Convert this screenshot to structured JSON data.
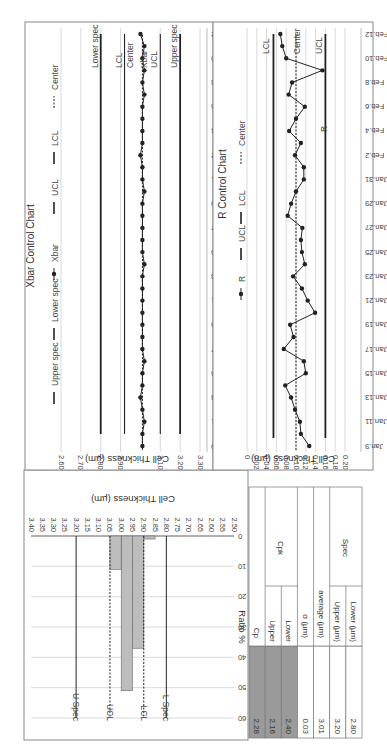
{
  "figure": {
    "orientation_deg": 180
  },
  "colors": {
    "frame": "#888888",
    "grid": "#cfcfcf",
    "line": "#222222",
    "bar_fill": "#bdbdbd",
    "table_shade": "#9a9a9a"
  },
  "chart_data": [
    {
      "type": "bar",
      "id": "histogram",
      "title": "",
      "xlabel": "Cell Thickness (µm)",
      "ylabel": "Ratio %",
      "categories": [
        "2.50",
        "2.55",
        "2.60",
        "2.65",
        "2.70",
        "2.75",
        "2.80",
        "2.85",
        "2.90",
        "2.95",
        "3.00",
        "3.05",
        "3.10",
        "3.15",
        "3.20",
        "3.25",
        "3.30",
        "3.35",
        "3.40"
      ],
      "values": [
        0,
        0,
        0,
        0,
        0,
        0,
        0,
        0,
        1,
        37,
        51,
        11,
        0,
        0,
        0,
        0,
        0,
        0,
        0
      ],
      "ylim": [
        0,
        60
      ],
      "yticks": [
        0,
        10,
        20,
        30,
        40,
        50,
        60
      ],
      "grid": true,
      "reference_lines": [
        {
          "label": "L Spec",
          "x": 2.8,
          "style": "solid"
        },
        {
          "label": "LCL",
          "x": 2.9,
          "style": "dashed"
        },
        {
          "label": "UCL",
          "x": 3.05,
          "style": "dashed"
        },
        {
          "label": "U Spec",
          "x": 3.2,
          "style": "solid"
        }
      ]
    },
    {
      "type": "line",
      "id": "xbar",
      "title": "Xbar Control Chart",
      "xlabel": "",
      "ylabel": "Cell Thickness (µm)",
      "ylim": [
        2.6,
        3.3
      ],
      "yticks": [
        "3.30",
        "3.20",
        "3.10",
        "2.90",
        "2.80",
        "2.70",
        "2.60"
      ],
      "x": [
        "Jan.9",
        "Jan.10",
        "Jan.11",
        "Jan.12",
        "Jan.13",
        "Jan.14",
        "Jan.15",
        "Jan.16",
        "Jan.17",
        "Jan.18",
        "Jan.19",
        "Jan.20",
        "Jan.21",
        "Jan.22",
        "Jan.23",
        "Jan.24",
        "Jan.25",
        "Jan.26",
        "Jan.27",
        "Jan.28",
        "Jan.29",
        "Jan.30",
        "Jan.31",
        "Feb.1",
        "Feb.2",
        "Feb.3",
        "Feb.4",
        "Feb.5",
        "Feb.6",
        "Feb.7",
        "Feb.8",
        "Feb.9",
        "Feb.10",
        "Feb.11",
        "Feb.12"
      ],
      "xtick_labels": [
        "Jan.9",
        "Jan.11",
        "Jan.13",
        "Jan.15",
        "Jan.17",
        "Jan.19",
        "Jan.21",
        "Jan.23",
        "Jan.25",
        "Jan.27",
        "Jan.29",
        "Jan.31",
        "Feb.2",
        "Feb.4",
        "Feb.6",
        "Feb.8",
        "Feb.10",
        "Feb.12"
      ],
      "series": [
        {
          "name": "Xbar",
          "values": [
            3.01,
            3.01,
            3.02,
            3.01,
            3.0,
            3.01,
            3.01,
            3.02,
            3.01,
            3.01,
            3.01,
            3.01,
            3.01,
            3.01,
            3.01,
            3.02,
            3.01,
            3.01,
            3.01,
            3.01,
            3.01,
            3.02,
            3.01,
            3.01,
            3.0,
            3.01,
            3.01,
            3.01,
            3.01,
            3.02,
            3.01,
            3.02,
            3.01,
            3.02,
            3.0
          ]
        },
        {
          "name": "Upper spec",
          "value": 3.2
        },
        {
          "name": "UCL",
          "value": 3.1
        },
        {
          "name": "Center",
          "value": 3.01
        },
        {
          "name": "LCL",
          "value": 2.92
        },
        {
          "name": "Lower spec",
          "value": 2.8
        }
      ],
      "legend": [
        "Upper spec",
        "Lower spec",
        "Xbar",
        "UCL",
        "LCL",
        "Center"
      ],
      "annotations": [
        "Upper spec",
        "UCL",
        "Xbar",
        "Center",
        "LCL",
        "Lower spec"
      ],
      "legend_position": "top"
    },
    {
      "type": "line",
      "id": "r",
      "title": "R Control Chart",
      "xlabel": "",
      "ylabel": "Cell Thickness (µm)",
      "ylim": [
        0,
        0.2
      ],
      "yticks": [
        "0.20",
        "0.18",
        "0.16",
        "0.14",
        "0.12",
        "0.10",
        "0.08",
        "0.06",
        "0.04",
        "0.02",
        "0"
      ],
      "x": [
        "Jan.9",
        "Jan.10",
        "Jan.11",
        "Jan.12",
        "Jan.13",
        "Jan.14",
        "Jan.15",
        "Jan.16",
        "Jan.17",
        "Jan.18",
        "Jan.19",
        "Jan.20",
        "Jan.21",
        "Jan.22",
        "Jan.23",
        "Jan.24",
        "Jan.25",
        "Jan.26",
        "Jan.27",
        "Jan.28",
        "Jan.29",
        "Jan.30",
        "Jan.31",
        "Feb.1",
        "Feb.2",
        "Feb.3",
        "Feb.4",
        "Feb.5",
        "Feb.6",
        "Feb.7",
        "Feb.8",
        "Feb.9",
        "Feb.10",
        "Feb.11",
        "Feb.12"
      ],
      "xtick_labels": [
        "Jan.9",
        "Jan.11",
        "Jan.13",
        "Jan.15",
        "Jan.17",
        "Jan.19",
        "Jan.21",
        "Jan.23",
        "Jan.25",
        "Jan.27",
        "Jan.29",
        "Jan.31",
        "Feb.2",
        "Feb.4",
        "Feb.6",
        "Feb.8",
        "Feb.10",
        "Feb.12"
      ],
      "series": [
        {
          "name": "R",
          "values": [
            0.127,
            0.11,
            0.108,
            0.098,
            0.09,
            0.078,
            0.12,
            0.116,
            0.075,
            0.095,
            0.088,
            0.139,
            0.124,
            0.112,
            0.094,
            0.118,
            0.112,
            0.11,
            0.113,
            0.083,
            0.09,
            0.1,
            0.116,
            0.116,
            0.098,
            0.11,
            0.086,
            0.1,
            0.118,
            0.085,
            0.092,
            0.154,
            0.08,
            0.072,
            0.068
          ]
        },
        {
          "name": "UCL",
          "value": 0.16
        },
        {
          "name": "Center",
          "value": 0.1
        },
        {
          "name": "LCL",
          "value": 0.054
        }
      ],
      "legend": [
        "R",
        "UCL",
        "LCL",
        "Center"
      ],
      "annotations": [
        "UCL",
        "Center",
        "R",
        "LCL"
      ],
      "legend_position": "top"
    }
  ],
  "table": {
    "rows": [
      {
        "group": "Cp",
        "sub": "",
        "value": "2.28",
        "shaded": true
      },
      {
        "group": "Cpk",
        "sub": "Upper",
        "value": "2.16",
        "shaded": true
      },
      {
        "group": "Cpk",
        "sub": "Lower",
        "value": "2.40",
        "shaded": true
      },
      {
        "group": "σ (µm)",
        "sub": "",
        "value": "0.03",
        "shaded": false
      },
      {
        "group": "average (µm)",
        "sub": "",
        "value": "3.01",
        "shaded": false
      },
      {
        "group": "Spec",
        "sub": "Upper (µm)",
        "value": "3.20",
        "shaded": false
      },
      {
        "group": "Spec",
        "sub": "Lower (µm)",
        "value": "2.80",
        "shaded": false
      }
    ]
  }
}
